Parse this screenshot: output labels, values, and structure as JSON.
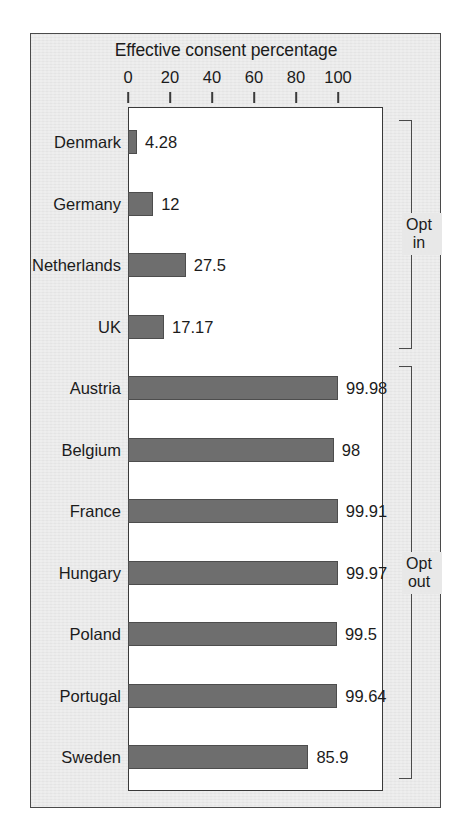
{
  "chart_data": {
    "type": "bar",
    "orientation": "horizontal",
    "title": "Effective consent percentage",
    "xlabel": "",
    "ylabel": "",
    "xlim": [
      0,
      120
    ],
    "xticks": [
      0,
      20,
      40,
      60,
      80,
      100
    ],
    "xtick_labels": [
      "0",
      "20",
      "40",
      "60",
      "80",
      "100"
    ],
    "grid": false,
    "legend": null,
    "categories": [
      "Denmark",
      "Germany",
      "Netherlands",
      "UK",
      "Austria",
      "Belgium",
      "France",
      "Hungary",
      "Poland",
      "Portugal",
      "Sweden"
    ],
    "values": [
      4.28,
      12,
      27.5,
      17.17,
      99.98,
      98,
      99.91,
      99.97,
      99.5,
      99.64,
      85.9
    ],
    "value_labels": [
      "4.28",
      "12",
      "27.5",
      "17.17",
      "99.98",
      "98",
      "99.91",
      "99.97",
      "99.5",
      "99.64",
      "85.9"
    ],
    "groups": [
      {
        "label_lines": [
          "Opt",
          "in"
        ],
        "first_index": 0,
        "last_index": 3
      },
      {
        "label_lines": [
          "Opt",
          "out"
        ],
        "first_index": 4,
        "last_index": 10
      }
    ],
    "colors": {
      "bar_fill": "#6e6e6e",
      "bar_stroke": "#4d4d4d",
      "plot_background": "#ffffff",
      "card_background": "#e8e8e8",
      "axis": "#3a3a3a",
      "text": "#1b1b1b"
    }
  }
}
